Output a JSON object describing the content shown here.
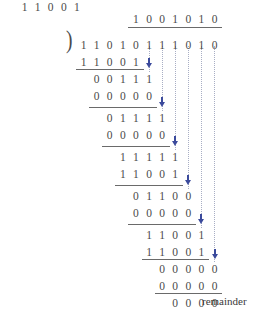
{
  "figure": {
    "type": "binary-long-division",
    "title": "",
    "divisor": "11001",
    "dividend": "11010111010",
    "quotient": "1001010",
    "remainder": "0000",
    "remainder_label": "remainder",
    "bracket_glyph": ")",
    "colors": {
      "digit": "#4a4a4a",
      "rule": "#6a6a6a",
      "guide": "#a8aec4",
      "arrow": "#3b4a9c",
      "label": "#3a3a3a",
      "background": "#ffffff"
    },
    "rows": [
      {
        "name": "quotient",
        "digits": "1001010",
        "start_col": 4,
        "y": 12
      },
      {
        "name": "dividend",
        "digits": "11010111010",
        "start_col": 0,
        "y": 38
      },
      {
        "name": "subtrahend-1",
        "digits": "11001",
        "start_col": 0,
        "y": 55
      },
      {
        "name": "partial-1",
        "digits": "00111",
        "start_col": 1,
        "y": 72
      },
      {
        "name": "subtrahend-2",
        "digits": "00000",
        "start_col": 1,
        "y": 89
      },
      {
        "name": "partial-2",
        "digits": "01111",
        "start_col": 2,
        "y": 111
      },
      {
        "name": "subtrahend-3",
        "digits": "00000",
        "start_col": 2,
        "y": 128
      },
      {
        "name": "partial-3",
        "digits": "11111",
        "start_col": 3,
        "y": 150
      },
      {
        "name": "subtrahend-4",
        "digits": "11001",
        "start_col": 3,
        "y": 167
      },
      {
        "name": "partial-4",
        "digits": "01100",
        "start_col": 4,
        "y": 189
      },
      {
        "name": "subtrahend-5",
        "digits": "00000",
        "start_col": 4,
        "y": 206
      },
      {
        "name": "partial-5",
        "digits": "11001",
        "start_col": 5,
        "y": 228
      },
      {
        "name": "subtrahend-6",
        "digits": "11001",
        "start_col": 5,
        "y": 245
      },
      {
        "name": "partial-6",
        "digits": "00000",
        "start_col": 6,
        "y": 262
      },
      {
        "name": "subtrahend-7",
        "digits": "00000",
        "start_col": 6,
        "y": 279
      },
      {
        "name": "remainder",
        "digits": "0000",
        "start_col": 7,
        "y": 296
      }
    ],
    "bars": [
      {
        "name": "vinculum",
        "start_col": 4,
        "span": 7,
        "y": 27
      },
      {
        "name": "rule-1",
        "start_col": 0,
        "span": 5,
        "y": 69
      },
      {
        "name": "rule-2",
        "start_col": 1,
        "span": 5,
        "y": 107
      },
      {
        "name": "rule-3",
        "start_col": 2,
        "span": 5,
        "y": 146
      },
      {
        "name": "rule-4",
        "start_col": 3,
        "span": 5,
        "y": 185
      },
      {
        "name": "rule-5",
        "start_col": 4,
        "span": 5,
        "y": 224
      },
      {
        "name": "rule-6",
        "start_col": 5,
        "span": 5,
        "y": 259
      },
      {
        "name": "rule-7",
        "start_col": 6,
        "span": 5,
        "y": 293
      }
    ],
    "guides": [
      {
        "name": "guide-col-5",
        "col": 5,
        "y": 46,
        "height": 26
      },
      {
        "name": "guide-col-6",
        "col": 6,
        "y": 46,
        "height": 65
      },
      {
        "name": "guide-col-7",
        "col": 7,
        "y": 46,
        "height": 104
      },
      {
        "name": "guide-col-8",
        "col": 8,
        "y": 46,
        "height": 143
      },
      {
        "name": "guide-col-9",
        "col": 9,
        "y": 46,
        "height": 182
      },
      {
        "name": "guide-col-10",
        "col": 10,
        "y": 46,
        "height": 216
      }
    ],
    "arrows": [
      {
        "name": "bringdown-arrow-1",
        "col": 5,
        "y": 63
      },
      {
        "name": "bringdown-arrow-2",
        "col": 6,
        "y": 102
      },
      {
        "name": "bringdown-arrow-3",
        "col": 7,
        "y": 141
      },
      {
        "name": "bringdown-arrow-4",
        "col": 8,
        "y": 180
      },
      {
        "name": "bringdown-arrow-5",
        "col": 9,
        "y": 219
      },
      {
        "name": "bringdown-arrow-6",
        "col": 10,
        "y": 254
      }
    ],
    "geometry": {
      "col0_x": 77,
      "col_width": 13.1,
      "divisor_x": 18,
      "divisor_y": 38,
      "bracket_x": 66,
      "bracket_y": 27,
      "label_x": 202,
      "label_y": 295
    }
  }
}
